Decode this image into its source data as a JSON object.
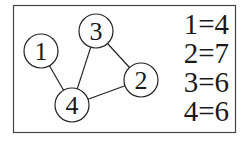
{
  "diagram": {
    "type": "graph",
    "nodes": [
      {
        "id": "1",
        "label": "1",
        "x": 41,
        "y": 51,
        "r": 17
      },
      {
        "id": "2",
        "label": "2",
        "x": 141,
        "y": 80,
        "r": 17
      },
      {
        "id": "3",
        "label": "3",
        "x": 96,
        "y": 31,
        "r": 17
      },
      {
        "id": "4",
        "label": "4",
        "x": 72,
        "y": 105,
        "r": 17
      }
    ],
    "edges": [
      {
        "from": "1",
        "to": "4"
      },
      {
        "from": "3",
        "to": "4"
      },
      {
        "from": "3",
        "to": "2"
      },
      {
        "from": "4",
        "to": "2"
      }
    ],
    "legend": [
      {
        "text": "1=4"
      },
      {
        "text": "2=7"
      },
      {
        "text": "3=6"
      },
      {
        "text": "4=6"
      }
    ],
    "colors": {
      "stroke": "#222222",
      "text": "#1a1a1a",
      "background": "#ffffff"
    }
  }
}
